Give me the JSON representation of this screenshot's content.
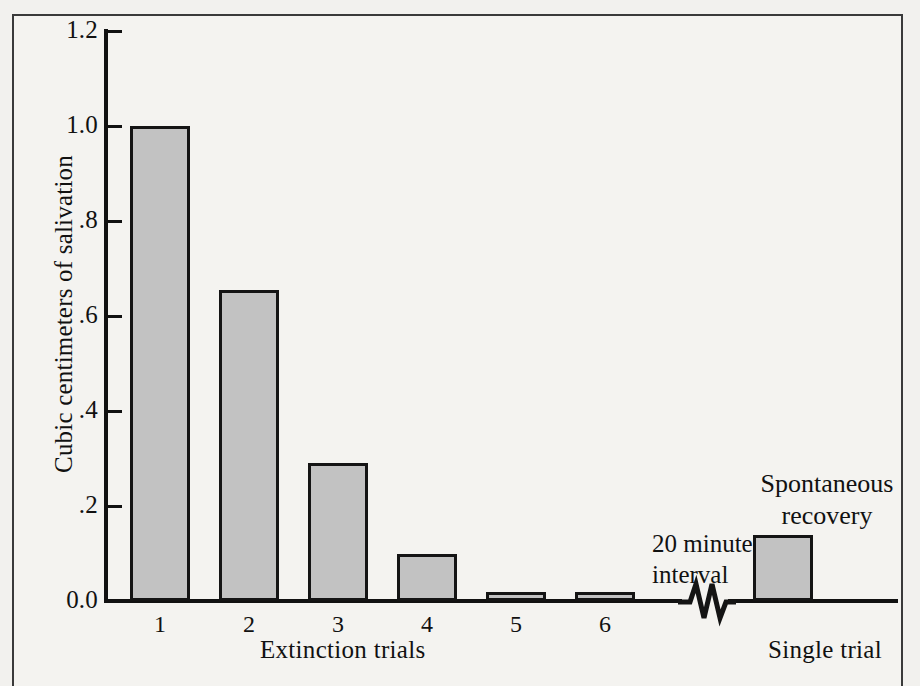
{
  "chart_data": {
    "type": "bar",
    "title": "",
    "xlabel": "Extinction trials",
    "ylabel": "Cubic centimeters of salivation",
    "categories": [
      "1",
      "2",
      "3",
      "4",
      "5",
      "6",
      "Single trial"
    ],
    "values": [
      1.0,
      0.655,
      0.29,
      0.1,
      0.02,
      0.01,
      0.14
    ],
    "ylim": [
      0.0,
      1.2
    ],
    "yticks": [
      "0.0",
      ".2",
      ".4",
      ".6",
      ".8",
      "1.0",
      "1.2"
    ],
    "ytick_values": [
      0.0,
      0.2,
      0.4,
      0.6,
      0.8,
      1.0,
      1.2
    ],
    "grid": false,
    "legend": "none",
    "bar_fill_color": "#c2c2c2",
    "bar_edge_color": "#141414",
    "background_color": "#f4f3f0",
    "annotations": [
      {
        "name": "interval-note",
        "text_line1": "20 minute",
        "text_line2": "interval"
      },
      {
        "name": "recovery-note",
        "text_line1": "Spontaneous",
        "text_line2": "recovery"
      },
      {
        "name": "single-trial-label",
        "text": "Single trial"
      }
    ],
    "axis_break": {
      "present": true,
      "shape": "zigzag",
      "between": [
        "6",
        "Single trial"
      ]
    }
  },
  "axis": {
    "y_title": "Cubic centimeters of salivation",
    "x_title": "Extinction trials",
    "ticks": [
      {
        "label": "1.2",
        "value": 1.2
      },
      {
        "label": "1.0",
        "value": 1.0
      },
      {
        "label": ".8",
        "value": 0.8
      },
      {
        "label": ".6",
        "value": 0.6
      },
      {
        "label": ".4",
        "value": 0.4
      },
      {
        "label": ".2",
        "value": 0.2
      },
      {
        "label": "0.0",
        "value": 0.0
      }
    ]
  },
  "bars": [
    {
      "label": "1",
      "value": 1.0
    },
    {
      "label": "2",
      "value": 0.655
    },
    {
      "label": "3",
      "value": 0.29
    },
    {
      "label": "4",
      "value": 0.1
    },
    {
      "label": "5",
      "value": 0.02
    },
    {
      "label": "6",
      "value": 0.01
    },
    {
      "label": "Single trial",
      "value": 0.14
    }
  ],
  "notes": {
    "interval_line1": "20 minute",
    "interval_line2": "interval",
    "recovery_line1": "Spontaneous",
    "recovery_line2": "recovery",
    "single_trial": "Single trial"
  }
}
